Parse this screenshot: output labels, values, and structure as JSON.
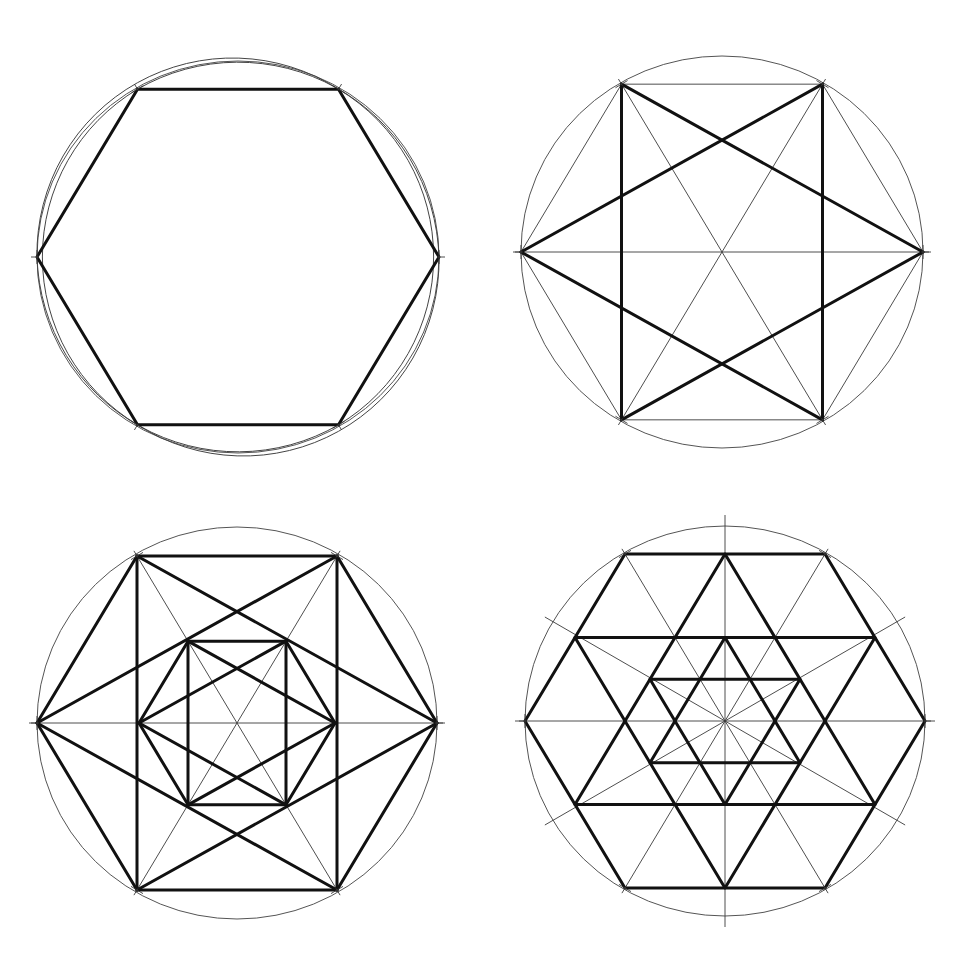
{
  "canvas": {
    "width": 962,
    "height": 958,
    "background": "#ffffff",
    "line_color": "#111111",
    "thin_color": "#3a3a3a"
  },
  "figures": [
    {
      "id": "fig1",
      "name": "hexagon-with-six-petal-rosette",
      "center": [
        238,
        257
      ],
      "radius": 201,
      "circle_ry": 196,
      "hexagon": {
        "scale": 1.0,
        "weight": "thick",
        "edges": "all"
      },
      "rosette_arcs": true,
      "tick_vertices": true
    },
    {
      "id": "fig2",
      "name": "hexagram-in-rectangle",
      "center": [
        722,
        252
      ],
      "radius": 201,
      "circle_ry": 196,
      "thin_lines": [
        "hex-top",
        "hex-bottom",
        "hex-left-upper",
        "hex-left-lower",
        "hex-right-upper",
        "hex-right-lower",
        "diameter-0",
        "diameter-60",
        "diameter-120"
      ],
      "thick_lines": [
        "rect-left",
        "rect-right",
        "star-L-TR",
        "star-L-BR",
        "star-R-TL",
        "star-R-BL"
      ],
      "tick_vertices": true
    },
    {
      "id": "fig3",
      "name": "nested-hexagons-with-stars",
      "center": [
        237,
        723
      ],
      "radius": 200,
      "circle_ry": 196,
      "inner_scale": 0.49,
      "thin_lines": [
        "diameter-0",
        "diameter-60",
        "diameter-120"
      ],
      "thick_lines": [
        "outer-hexagon",
        "outer-rect-verticals",
        "outer-star",
        "inner-hexagon",
        "inner-rect-verticals",
        "inner-star"
      ],
      "tick_vertices": true
    },
    {
      "id": "fig4",
      "name": "hexagon-with-nested-hexagrams",
      "center": [
        725,
        721
      ],
      "radius": 200,
      "circle_ry": 195,
      "outer_hexagram_radius": 168,
      "inner_hexagram_radius": 83,
      "thin_lines": [
        "diameter-0",
        "diameter-30",
        "diameter-60",
        "diameter-90",
        "diameter-120",
        "diameter-150"
      ],
      "thick_lines": [
        "outer-hexagon",
        "outer-hexagram",
        "inner-hexagram"
      ],
      "tick_vertices": true
    }
  ]
}
